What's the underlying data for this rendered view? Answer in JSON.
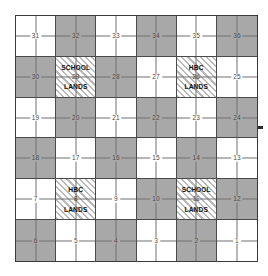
{
  "figure": {
    "type": "diagram",
    "grid": {
      "rows": 6,
      "columns": 6,
      "total_sections": 36
    },
    "colors": {
      "white_fill": "#ffffff",
      "gray_fill": "#a8a8a8",
      "hatch_line": "#b9b9b9",
      "border": "#3a3a3a",
      "inner_line": "#4a4a4a",
      "quarter_line": "#707070",
      "number_text": "#4a4a4a",
      "label_text": "#111111"
    },
    "legend_meaning": {
      "gray": "odd-numbered / alternate sections",
      "hatch": "reserved lands (School Lands and Hudson's Bay Company Lands)"
    }
  },
  "sections": [
    {
      "number": "31",
      "row": 1,
      "col": 1,
      "fill": "white",
      "label": null
    },
    {
      "number": "32",
      "row": 1,
      "col": 2,
      "fill": "gray",
      "label": null
    },
    {
      "number": "33",
      "row": 1,
      "col": 3,
      "fill": "white",
      "label": null
    },
    {
      "number": "34",
      "row": 1,
      "col": 4,
      "fill": "gray",
      "label": null
    },
    {
      "number": "35",
      "row": 1,
      "col": 5,
      "fill": "white",
      "label": null
    },
    {
      "number": "36",
      "row": 1,
      "col": 6,
      "fill": "gray",
      "label": null
    },
    {
      "number": "30",
      "row": 2,
      "col": 1,
      "fill": "gray",
      "label": null
    },
    {
      "number": "29",
      "row": 2,
      "col": 2,
      "fill": "hatch",
      "label": {
        "top": "SCHOOL",
        "bottom": "LANDS"
      }
    },
    {
      "number": "28",
      "row": 2,
      "col": 3,
      "fill": "gray",
      "label": null
    },
    {
      "number": "27",
      "row": 2,
      "col": 4,
      "fill": "white",
      "label": null
    },
    {
      "number": "26",
      "row": 2,
      "col": 5,
      "fill": "hatch",
      "label": {
        "top": "HBC",
        "bottom": "LANDS"
      }
    },
    {
      "number": "25",
      "row": 2,
      "col": 6,
      "fill": "white",
      "label": null
    },
    {
      "number": "19",
      "row": 3,
      "col": 1,
      "fill": "white",
      "label": null
    },
    {
      "number": "20",
      "row": 3,
      "col": 2,
      "fill": "gray",
      "label": null
    },
    {
      "number": "21",
      "row": 3,
      "col": 3,
      "fill": "white",
      "label": null
    },
    {
      "number": "22",
      "row": 3,
      "col": 4,
      "fill": "gray",
      "label": null
    },
    {
      "number": "23",
      "row": 3,
      "col": 5,
      "fill": "white",
      "label": null
    },
    {
      "number": "24",
      "row": 3,
      "col": 6,
      "fill": "gray",
      "label": null
    },
    {
      "number": "18",
      "row": 4,
      "col": 1,
      "fill": "gray",
      "label": null
    },
    {
      "number": "17",
      "row": 4,
      "col": 2,
      "fill": "white",
      "label": null
    },
    {
      "number": "16",
      "row": 4,
      "col": 3,
      "fill": "gray",
      "label": null
    },
    {
      "number": "15",
      "row": 4,
      "col": 4,
      "fill": "white",
      "label": null
    },
    {
      "number": "14",
      "row": 4,
      "col": 5,
      "fill": "gray",
      "label": null
    },
    {
      "number": "13",
      "row": 4,
      "col": 6,
      "fill": "white",
      "label": null
    },
    {
      "number": "7",
      "row": 5,
      "col": 1,
      "fill": "white",
      "label": null
    },
    {
      "number": "8",
      "row": 5,
      "col": 2,
      "fill": "hatch",
      "label": {
        "top": "HBC",
        "bottom": "LANDS"
      }
    },
    {
      "number": "9",
      "row": 5,
      "col": 3,
      "fill": "white",
      "label": null
    },
    {
      "number": "10",
      "row": 5,
      "col": 4,
      "fill": "gray",
      "label": null
    },
    {
      "number": "11",
      "row": 5,
      "col": 5,
      "fill": "hatch",
      "label": {
        "top": "SCHOOL",
        "bottom": "LANDS"
      }
    },
    {
      "number": "12",
      "row": 5,
      "col": 6,
      "fill": "gray",
      "label": null
    },
    {
      "number": "6",
      "row": 6,
      "col": 1,
      "fill": "gray",
      "label": null
    },
    {
      "number": "5",
      "row": 6,
      "col": 2,
      "fill": "white",
      "label": null
    },
    {
      "number": "4",
      "row": 6,
      "col": 3,
      "fill": "gray",
      "label": null
    },
    {
      "number": "3",
      "row": 6,
      "col": 4,
      "fill": "white",
      "label": null
    },
    {
      "number": "2",
      "row": 6,
      "col": 5,
      "fill": "gray",
      "label": null
    },
    {
      "number": "1",
      "row": 6,
      "col": 6,
      "fill": "white",
      "label": null
    }
  ]
}
